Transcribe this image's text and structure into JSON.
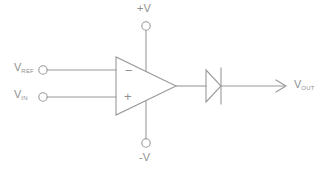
{
  "diagram": {
    "stroke_color": "#9a9a9a",
    "text_color": "#8f8f8f",
    "background_color": "#ffffff",
    "width": 324,
    "height": 173
  },
  "labels": {
    "v_ref": {
      "main": "V",
      "sub": "REF"
    },
    "v_in": {
      "main": "V",
      "sub": "IN"
    },
    "v_out": {
      "main": "V",
      "sub": "OUT"
    },
    "v_supply_positive": "+V",
    "v_supply_negative": "-V",
    "inverting_sign": "−",
    "noninverting_sign": "+"
  },
  "components": {
    "opamp": {
      "name": "operational amplifier",
      "symbol": "triangle"
    },
    "diode": {
      "name": "diode",
      "symbol": "triangle-with-bar"
    },
    "terminal_v_ref": {
      "name": "input terminal",
      "symbol": "circle"
    },
    "terminal_v_in": {
      "name": "input terminal",
      "symbol": "circle"
    },
    "terminal_v_plus": {
      "name": "supply terminal",
      "symbol": "circle"
    },
    "terminal_v_minus": {
      "name": "supply terminal",
      "symbol": "circle"
    },
    "output_arrow": {
      "name": "output arrow",
      "symbol": "arrow-right"
    }
  }
}
